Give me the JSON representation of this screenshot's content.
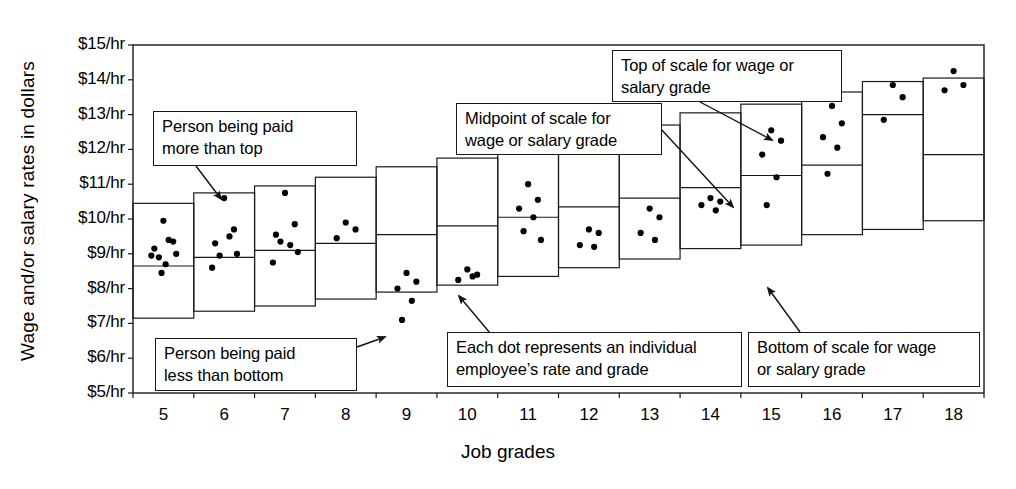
{
  "chart_data": {
    "type": "bar",
    "title": "",
    "xlabel": "Job grades",
    "ylabel": "Wage and/or salary rates in dollars",
    "ylim": [
      5,
      15
    ],
    "ytick_labels": [
      "$15/hr",
      "$14/hr",
      "$13/hr",
      "$12/hr",
      "$11/hr",
      "$10/hr",
      "$9/hr",
      "$8/hr",
      "$7/hr",
      "$6/hr",
      "$5/hr"
    ],
    "ytick_values": [
      15,
      14,
      13,
      12,
      11,
      10,
      9,
      8,
      7,
      6,
      5
    ],
    "grid": false,
    "legend": "none",
    "categories": [
      "5",
      "6",
      "7",
      "8",
      "9",
      "10",
      "11",
      "12",
      "13",
      "14",
      "15",
      "16",
      "17",
      "18"
    ],
    "series": [
      {
        "name": "Top of scale",
        "values": [
          10.45,
          10.75,
          10.95,
          11.2,
          11.5,
          11.75,
          12.05,
          12.4,
          12.7,
          13.05,
          13.3,
          13.65,
          13.95,
          14.05
        ]
      },
      {
        "name": "Midpoint of scale",
        "values": [
          8.65,
          8.9,
          9.1,
          9.3,
          9.55,
          9.8,
          10.05,
          10.35,
          10.6,
          10.9,
          11.25,
          11.55,
          13.0,
          11.85
        ]
      },
      {
        "name": "Bottom of scale",
        "values": [
          7.15,
          7.35,
          7.5,
          7.7,
          7.9,
          8.1,
          8.35,
          8.6,
          8.85,
          9.15,
          9.25,
          9.55,
          9.7,
          9.95
        ]
      }
    ],
    "dots": [
      {
        "grade": "5",
        "rates": [
          9.95,
          9.35,
          9.15,
          9.4,
          8.9,
          9.0,
          8.95,
          8.7,
          8.45
        ]
      },
      {
        "grade": "6",
        "rates": [
          10.6,
          9.7,
          9.3,
          9.5,
          8.95,
          9.0,
          8.6
        ]
      },
      {
        "grade": "7",
        "rates": [
          10.75,
          9.85,
          9.55,
          9.25,
          9.35,
          9.05,
          8.75
        ]
      },
      {
        "grade": "8",
        "rates": [
          9.9,
          9.7,
          9.45
        ]
      },
      {
        "grade": "9",
        "rates": [
          8.45,
          8.2,
          8.0,
          7.65,
          7.1
        ]
      },
      {
        "grade": "10",
        "rates": [
          8.55,
          8.4,
          8.25,
          8.35
        ]
      },
      {
        "grade": "11",
        "rates": [
          11.0,
          10.55,
          10.3,
          10.05,
          9.65,
          9.4
        ]
      },
      {
        "grade": "12",
        "rates": [
          9.7,
          9.6,
          9.25,
          9.2
        ]
      },
      {
        "grade": "13",
        "rates": [
          10.3,
          10.05,
          9.6,
          9.4
        ]
      },
      {
        "grade": "14",
        "rates": [
          10.6,
          10.5,
          10.4,
          10.25
        ]
      },
      {
        "grade": "15",
        "rates": [
          12.55,
          12.25,
          11.85,
          11.2,
          10.4
        ]
      },
      {
        "grade": "16",
        "rates": [
          13.25,
          12.75,
          12.35,
          12.05,
          11.3
        ]
      },
      {
        "grade": "17",
        "rates": [
          13.85,
          13.5,
          12.85
        ]
      },
      {
        "grade": "18",
        "rates": [
          14.25,
          13.85,
          13.7
        ]
      }
    ],
    "annotations": [
      {
        "id": "person-paid-more",
        "text_line1": "Person being paid",
        "text_line2": "more than top"
      },
      {
        "id": "person-paid-less",
        "text_line1": "Person being paid",
        "text_line2": "less than bottom"
      },
      {
        "id": "midpoint-of-scale",
        "text_line1": "Midpoint of scale for",
        "text_line2": "wage or salary grade"
      },
      {
        "id": "top-of-scale",
        "text_line1": "Top of scale for wage or",
        "text_line2": "salary grade"
      },
      {
        "id": "each-dot",
        "text_line1": "Each dot represents an individual",
        "text_line2": "employee’s rate and grade"
      },
      {
        "id": "bottom-of-scale",
        "text_line1": "Bottom of scale for wage",
        "text_line2": "or salary grade"
      }
    ],
    "colors": {
      "line": "#1a1a1a",
      "dot": "#000000",
      "background": "#ffffff"
    }
  }
}
